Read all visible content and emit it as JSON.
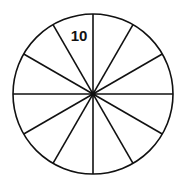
{
  "diagram": {
    "shape": "circle",
    "sectors": 12,
    "center": [
      93,
      94
    ],
    "radius": 80,
    "stroke_color": "#111111",
    "labels": [
      {
        "text": "10",
        "sector_index": 11,
        "x": 79,
        "y": 41
      }
    ]
  }
}
